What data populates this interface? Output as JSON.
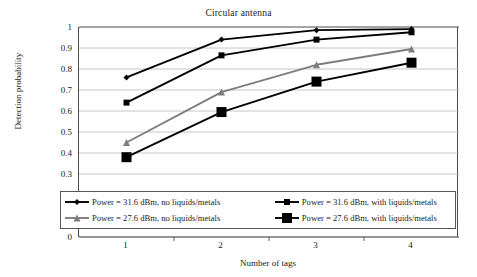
{
  "chart_data": {
    "type": "line",
    "title": "Circular antenna",
    "xlabel": "Number of tags",
    "ylabel": "Detection probability",
    "categories": [
      "1",
      "2",
      "3",
      "4"
    ],
    "x": [
      1,
      2,
      3,
      4
    ],
    "ylim": [
      0,
      1
    ],
    "yticks": [
      "0",
      "0.1",
      "0.2",
      "0.3",
      "0.4",
      "0.5",
      "0.6",
      "0.7",
      "0.8",
      "0.9",
      "1"
    ],
    "ytick_values": [
      0,
      0.1,
      0.2,
      0.3,
      0.4,
      0.5,
      0.6,
      0.7,
      0.8,
      0.9,
      1
    ],
    "grid": "horizontal",
    "legend_position": "inside-bottom",
    "series": [
      {
        "name": "Power = 31.6 dBm, no liquids/metals",
        "marker": "diamond",
        "color": "#000000",
        "marker_size": 6,
        "values": [
          0.76,
          0.94,
          0.985,
          0.99
        ]
      },
      {
        "name": "Power = 31.6 dBm, with liquids/metals",
        "marker": "square",
        "color": "#000000",
        "marker_size": 6,
        "values": [
          0.64,
          0.865,
          0.94,
          0.975
        ]
      },
      {
        "name": "Power = 27.6 dBm, no liquids/metals",
        "marker": "triangle",
        "color": "#7d7d7d",
        "marker_size": 7,
        "values": [
          0.45,
          0.69,
          0.82,
          0.895
        ]
      },
      {
        "name": "Power = 27.6 dBm, with liquids/metals",
        "marker": "square",
        "color": "#000000",
        "marker_size": 10,
        "values": [
          0.38,
          0.595,
          0.74,
          0.83
        ]
      }
    ]
  },
  "legend": {
    "rows": [
      {
        "left": "Power = 31.6 dBm, no liquids/metals",
        "right": "Power = 31.6 dBm, with liquids/metals"
      },
      {
        "left": "Power = 27.6 dBm, no liquids/metals",
        "right": "Power = 27.6 dBm, with liquids/metals"
      }
    ]
  },
  "colors": {
    "axis": "#4a4a4a",
    "grid": "#b8b8b8",
    "series_black": "#000000",
    "series_gray": "#7d7d7d",
    "text": "#1a1a1a",
    "background": "#ffffff"
  }
}
